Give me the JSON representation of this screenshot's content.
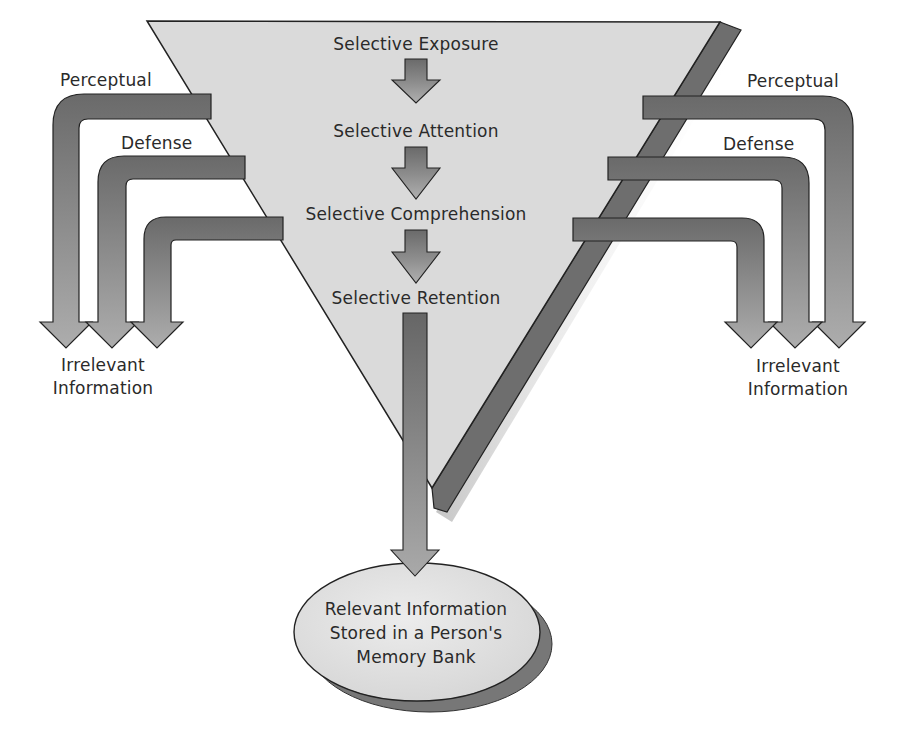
{
  "diagram": {
    "type": "selective-perception-funnel",
    "funnel_stages": [
      {
        "label": "Selective Exposure"
      },
      {
        "label": "Selective Attention"
      },
      {
        "label": "Selective Comprehension"
      },
      {
        "label": "Selective Retention"
      }
    ],
    "left_branch": {
      "labels": {
        "perceptual": "Perceptual",
        "defense": "Defense"
      },
      "output_line1": "Irrelevant",
      "output_line2": "Information"
    },
    "right_branch": {
      "labels": {
        "perceptual": "Perceptual",
        "defense": "Defense"
      },
      "output_line1": "Irrelevant",
      "output_line2": "Information"
    },
    "result": {
      "line1": "Relevant Information",
      "line2": "Stored in a Person's",
      "line3": "Memory Bank"
    },
    "colors": {
      "funnel_fill": "#dadada",
      "funnel_shadow": "#6e6e6e",
      "arrow_dark": "#6a6a6a",
      "arrow_light": "#a8a8a8",
      "outline": "#222222",
      "text": "#2a2a2a",
      "ellipse_fill": "#e0e0e0",
      "ellipse_shadow": "#777777"
    }
  }
}
